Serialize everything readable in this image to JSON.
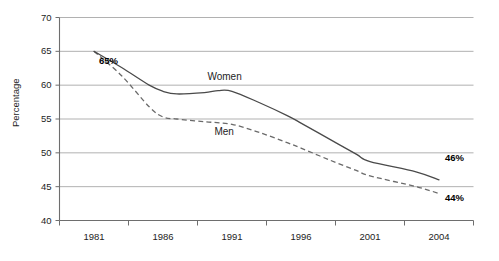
{
  "chart_data": {
    "type": "line",
    "title": "",
    "xlabel": "",
    "ylabel": "Percentage",
    "xlim": [
      1979.5,
      2005.5
    ],
    "ylim": [
      40,
      70
    ],
    "grid": true,
    "legend_position": "inline-labels",
    "y_ticks": [
      70,
      65,
      60,
      55,
      50,
      45,
      40
    ],
    "x_ticks": [
      1981,
      1986,
      1991,
      1996,
      2001,
      2004
    ],
    "series": [
      {
        "name": "Women",
        "style": "solid",
        "color": "#4a4a4a",
        "x": [
          1981,
          1983,
          1985,
          1986,
          1987,
          1989,
          1990,
          1991,
          1993,
          1995,
          1996,
          1998,
          2000,
          2001,
          2003,
          2004
        ],
        "values": [
          65.0,
          62.6,
          60.0,
          59.1,
          58.7,
          58.9,
          59.2,
          59.1,
          57.4,
          55.5,
          54.4,
          52.1,
          49.8,
          48.7,
          47.2,
          46.0
        ]
      },
      {
        "name": "Men",
        "style": "dashed",
        "color": "#6a6a6a",
        "x": [
          1981,
          1983,
          1985,
          1986,
          1987,
          1989,
          1991,
          1993,
          1995,
          1996,
          1998,
          2000,
          2001,
          2003,
          2004
        ],
        "values": [
          65.0,
          61.4,
          56.8,
          55.3,
          55.0,
          54.6,
          54.2,
          53.0,
          51.5,
          50.7,
          49.0,
          47.4,
          46.6,
          45.0,
          44.0
        ]
      }
    ],
    "annotations": [
      {
        "text": "65%",
        "x": 1981,
        "y": 65,
        "bold": true
      },
      {
        "text": "46%",
        "x": 2004,
        "y": 49.3,
        "bold": true
      },
      {
        "text": "44%",
        "x": 2004,
        "y": 43.3,
        "bold": true
      }
    ],
    "inline_series_labels": [
      {
        "text": "Women",
        "x": 1990.6,
        "y": 61.2
      },
      {
        "text": "Men",
        "x": 1991.1,
        "y": 53.1
      }
    ]
  },
  "axes": {
    "y_title": "Percentage",
    "y_tick_labels": [
      "70",
      "65",
      "60",
      "55",
      "50",
      "45",
      "40"
    ],
    "x_tick_labels": [
      "1981",
      "1986",
      "1991",
      "1996",
      "2001",
      "2004"
    ]
  },
  "labels": {
    "women": "Women",
    "men": "Men",
    "start_value": "65%",
    "women_end_value": "46%",
    "men_end_value": "44%"
  }
}
